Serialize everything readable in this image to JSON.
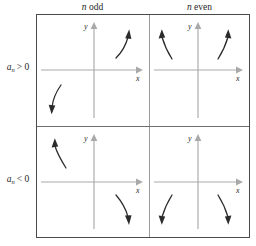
{
  "figure": {
    "columns": [
      {
        "id": "odd",
        "prefix": "n",
        "label": " odd"
      },
      {
        "id": "even",
        "prefix": "n",
        "label": " even"
      }
    ],
    "rows": [
      {
        "id": "positive",
        "coefficient": "a",
        "subscript": "n",
        "relation": "> 0",
        "full_label": "a_n > 0"
      },
      {
        "id": "negative",
        "coefficient": "a",
        "subscript": "n",
        "relation": "< 0",
        "full_label": "a_n < 0"
      }
    ],
    "axis_labels": {
      "x": "x",
      "y": "y"
    },
    "colors": {
      "border": "#4a4a4a",
      "divider_vertical": "#9a9a9a",
      "divider_horizontal": "#6e6e6e",
      "axis": "#a9a9a9",
      "curve": "#2b2b2b",
      "text": "#1f1f1f",
      "background": "#ffffff"
    },
    "cells": [
      {
        "id": "odd-positive",
        "column": "n odd",
        "row": "a_n > 0",
        "description": "Left end falls, right end rises",
        "arrows": [
          {
            "quadrant": "III",
            "direction": "down-left",
            "points": "down"
          },
          {
            "quadrant": "I",
            "direction": "up-right",
            "points": "up"
          }
        ]
      },
      {
        "id": "even-positive",
        "column": "n even",
        "row": "a_n > 0",
        "description": "Both ends rise",
        "arrows": [
          {
            "quadrant": "II",
            "direction": "up-left",
            "points": "up"
          },
          {
            "quadrant": "I",
            "direction": "up-right",
            "points": "up"
          }
        ]
      },
      {
        "id": "odd-negative",
        "column": "n odd",
        "row": "a_n < 0",
        "description": "Left end rises, right end falls",
        "arrows": [
          {
            "quadrant": "II",
            "direction": "up-left",
            "points": "up"
          },
          {
            "quadrant": "IV",
            "direction": "down-right",
            "points": "down"
          }
        ]
      },
      {
        "id": "even-negative",
        "column": "n even",
        "row": "a_n < 0",
        "description": "Both ends fall",
        "arrows": [
          {
            "quadrant": "III",
            "direction": "down-left",
            "points": "down"
          },
          {
            "quadrant": "IV",
            "direction": "down-right",
            "points": "down"
          }
        ]
      }
    ]
  }
}
